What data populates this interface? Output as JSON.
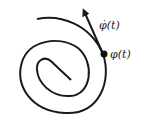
{
  "diagram": {
    "labels": {
      "velocity": "φ̇(t)",
      "point": "φ(t)"
    },
    "colors": {
      "curve": "#1a1a1a",
      "background": "#ffffff"
    }
  }
}
